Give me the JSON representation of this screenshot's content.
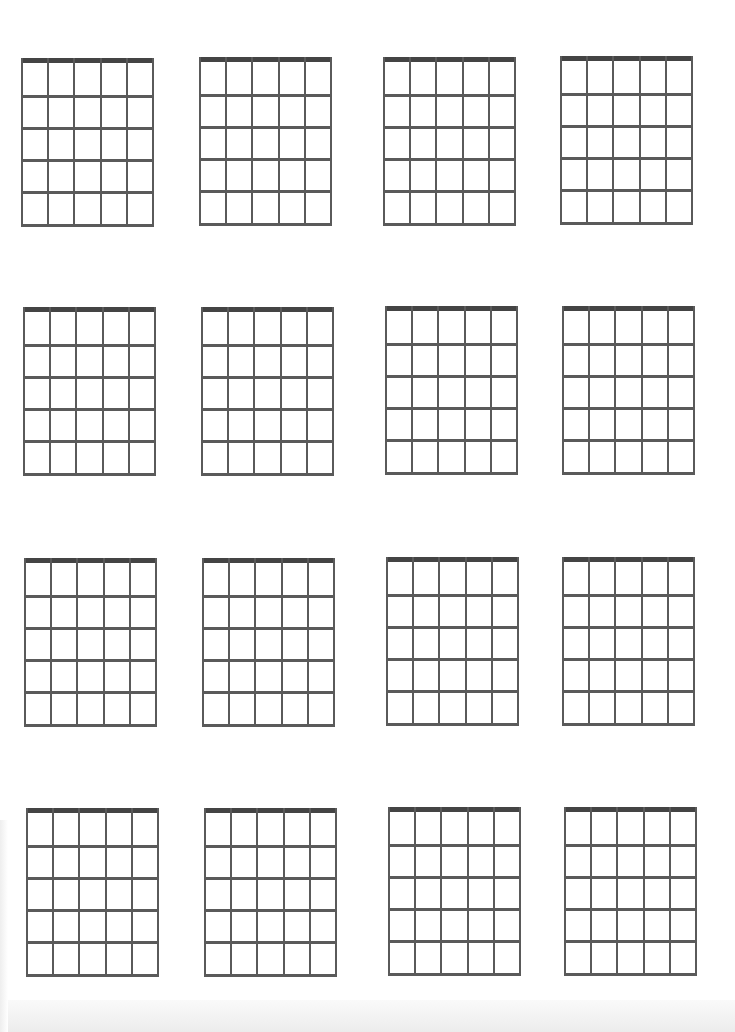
{
  "sheet": {
    "title": "Blank guitar chord chart",
    "strings_per_diagram": 6,
    "frets_per_diagram": 5,
    "rows": 4,
    "columns": 4,
    "colors": {
      "background": "#ffffff",
      "line": "#5a5a5a",
      "nut": "#444444"
    }
  },
  "diagrams": [
    {
      "id": 1,
      "x": 21,
      "y": 58
    },
    {
      "id": 2,
      "x": 199,
      "y": 57
    },
    {
      "id": 3,
      "x": 383,
      "y": 57
    },
    {
      "id": 4,
      "x": 560,
      "y": 56
    },
    {
      "id": 5,
      "x": 23,
      "y": 307
    },
    {
      "id": 6,
      "x": 201,
      "y": 307
    },
    {
      "id": 7,
      "x": 385,
      "y": 306
    },
    {
      "id": 8,
      "x": 562,
      "y": 306
    },
    {
      "id": 9,
      "x": 24,
      "y": 558
    },
    {
      "id": 10,
      "x": 202,
      "y": 558
    },
    {
      "id": 11,
      "x": 386,
      "y": 557
    },
    {
      "id": 12,
      "x": 562,
      "y": 557
    },
    {
      "id": 13,
      "x": 26,
      "y": 808
    },
    {
      "id": 14,
      "x": 204,
      "y": 808
    },
    {
      "id": 15,
      "x": 388,
      "y": 807
    },
    {
      "id": 16,
      "x": 564,
      "y": 807
    }
  ]
}
